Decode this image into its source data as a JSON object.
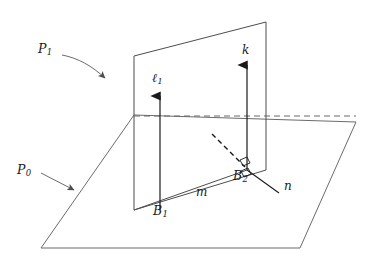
{
  "figure": {
    "background_color": "#ffffff",
    "stroke_color": "#4d4d4d",
    "dark_stroke_color": "#1a1a1a",
    "width": 377,
    "height": 265
  },
  "labels": {
    "plane0": {
      "base": "P",
      "sub": "0",
      "x": 17,
      "y": 172
    },
    "plane1": {
      "base": "P",
      "sub": "1",
      "x": 38,
      "y": 50
    },
    "line_l1": {
      "base": "ℓ",
      "sub": "1",
      "x": 152,
      "y": 78
    },
    "line_k": {
      "base": "k",
      "sub": "",
      "x": 242,
      "y": 50
    },
    "line_m": {
      "base": "m",
      "sub": "",
      "x": 196,
      "y": 192
    },
    "line_n": {
      "base": "n",
      "sub": "",
      "x": 284,
      "y": 186
    },
    "point_B1": {
      "base": "B",
      "sub": "1",
      "x": 153,
      "y": 212
    },
    "point_B2": {
      "base": "B",
      "sub": "2",
      "x": 233,
      "y": 176
    }
  },
  "geometry": {
    "plane0_points": "134,115 356,122 300,248 41,248",
    "plane1_points": "134,56 266,22 266,170 134,210",
    "intersection_dashed": {
      "x1": 134,
      "y1": 116,
      "x2": 356,
      "y2": 116
    },
    "line_m": {
      "x1": 134,
      "y1": 210,
      "x2": 247,
      "y2": 170
    },
    "line_n": {
      "x1": 247,
      "y1": 170,
      "x2": 279,
      "y2": 193
    },
    "dashed_ray": {
      "x1": 212,
      "y1": 134,
      "x2": 245,
      "y2": 167
    },
    "arrow_l1": {
      "x": 160,
      "y_base": 210,
      "y_tip": 92
    },
    "arrow_k": {
      "x": 247,
      "y_base": 170,
      "y_tip": 61
    },
    "pointer_plane1": {
      "path": "M 62,55 C 78,58 92,66 105,78"
    },
    "pointer_plane0": {
      "x1": 41,
      "y1": 173,
      "x2": 76,
      "y2": 191
    },
    "right_angle_upper": "240,160 247,157 250,163 243,166",
    "right_angle_lower": "241,171 248,168 251,174 244,177"
  }
}
